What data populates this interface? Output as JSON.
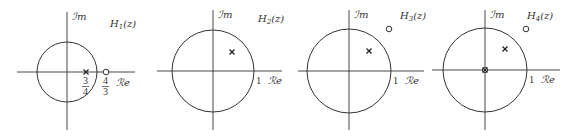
{
  "figure": {
    "panels": [
      {
        "title": "H1(z)",
        "im_label": "Im",
        "re_label": "Re",
        "origin": [
          67,
          72
        ],
        "radius": 30,
        "axis_x": [
          17,
          135
        ],
        "axis_y": [
          12,
          130
        ],
        "poles": [
          [
            86,
            72
          ]
        ],
        "zeros": [
          [
            106,
            72
          ]
        ],
        "pole_label_num": "3",
        "pole_label_den": "4",
        "zero_label_num": "4",
        "zero_label_den": "3",
        "one_label": ""
      },
      {
        "title": "H2(z)",
        "im_label": "Im",
        "re_label": "Re",
        "origin": [
          213,
          71
        ],
        "radius": 41,
        "axis_x": [
          157,
          282
        ],
        "axis_y": [
          10,
          130
        ],
        "poles": [
          [
            232,
            52
          ]
        ],
        "zeros": [],
        "one_label": "1"
      },
      {
        "title": "H3(z)",
        "im_label": "Im",
        "re_label": "Re",
        "origin": [
          349,
          71
        ],
        "radius": 42,
        "axis_x": [
          298,
          424
        ],
        "axis_y": [
          10,
          130
        ],
        "poles": [
          [
            369,
            51
          ]
        ],
        "zeros": [
          [
            389,
            29
          ]
        ],
        "one_label": "1"
      },
      {
        "title": "H4(z)",
        "im_label": "Im",
        "re_label": "Re",
        "origin": [
          485,
          70
        ],
        "radius": 42,
        "axis_x": [
          432,
          560
        ],
        "axis_y": [
          10,
          130
        ],
        "poles": [
          [
            505,
            49
          ],
          [
            485,
            70
          ]
        ],
        "zeros": [
          [
            526,
            29
          ],
          [
            485,
            70
          ]
        ],
        "one_label": "1"
      }
    ]
  },
  "labels": {
    "p1": {
      "title_main": "H",
      "title_sub": "1",
      "title_tail": "(z)",
      "im": "ℐm",
      "re": "ℛe",
      "pole_num": "3",
      "pole_den": "4",
      "zero_num": "4",
      "zero_den": "3"
    },
    "p2": {
      "title_main": "H",
      "title_sub": "2",
      "title_tail": "(z)",
      "im": "ℐm",
      "re": "ℛe",
      "one": "1"
    },
    "p3": {
      "title_main": "H",
      "title_sub": "3",
      "title_tail": "(z)",
      "im": "ℐm",
      "re": "ℛe",
      "one": "1"
    },
    "p4": {
      "title_main": "H",
      "title_sub": "4",
      "title_tail": "(z)",
      "im": "ℐm",
      "re": "ℛe",
      "one": "1"
    }
  }
}
